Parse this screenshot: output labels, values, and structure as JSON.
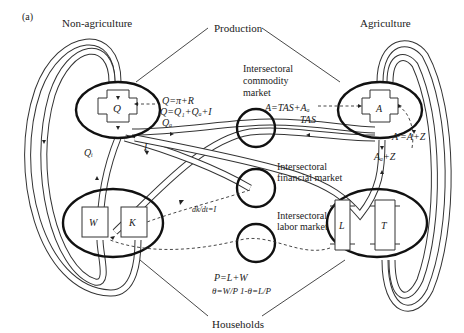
{
  "figure": {
    "panel_label": "(a)",
    "sectors": {
      "left": "Non-agriculture",
      "right": "Agriculture"
    },
    "group_labels": {
      "production": "Production",
      "households": "Households"
    },
    "nodes": {
      "Q": "Q",
      "A": "A",
      "W": "W",
      "K": "K",
      "L": "L",
      "T": "T"
    },
    "markets": {
      "commodity": [
        "Intersectoral",
        "commodity",
        "market"
      ],
      "financial": [
        "Intersectoral",
        "financial market"
      ],
      "labor": [
        "Intersectoral",
        "labor market"
      ]
    },
    "equations": {
      "q_def": "Q=π+R",
      "q_sum": "Q=Q₁+Qₐ+I",
      "a_def": "A=TAS+Aₐ",
      "a_f": "Aⁱ=A+Z",
      "a_a_z": "Aₐ+Z",
      "dk_dt": "dk/dt=I",
      "p_def": "P=L+W",
      "theta": "θ=W/P  1-θ=L/P"
    },
    "flow_labels": {
      "q_a": "Qₐ",
      "q_i": "Qᵢ",
      "i": "I",
      "tas": "TAS"
    },
    "colors": {
      "ink": "#222222",
      "background": "#ffffff"
    }
  }
}
